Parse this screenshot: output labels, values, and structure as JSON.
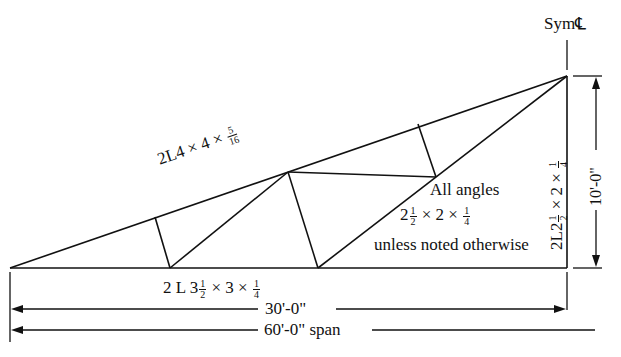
{
  "figure": {
    "symmetry_label": "Sym",
    "centerline_symbol": "℄",
    "top_chord": {
      "prefix": "2L4 × 4 ×",
      "frac_num": "5",
      "frac_den": "16"
    },
    "bottom_chord": {
      "prefix": "2 L 3",
      "frac1_num": "1",
      "frac1_den": "2",
      "middle": "× 3  ×",
      "frac2_num": "1",
      "frac2_den": "4"
    },
    "vertical_member": {
      "prefix": "2L2",
      "frac1_num": "1",
      "frac1_den": "2",
      "middle": "× 2 ×",
      "frac2_num": "1",
      "frac2_den": "4"
    },
    "note": {
      "line1": "All angles",
      "line2_prefix": "2",
      "line2_frac1_num": "1",
      "line2_frac1_den": "2",
      "line2_middle": "× 2 ×",
      "line2_frac2_num": "1",
      "line2_frac2_den": "4",
      "line3": "unless noted otherwise"
    },
    "dimensions": {
      "height": "10'-0\"",
      "half_span": "30'-0\"",
      "full_span": "60'-0\" span"
    },
    "colors": {
      "line": "#111111",
      "background": "#ffffff"
    }
  }
}
